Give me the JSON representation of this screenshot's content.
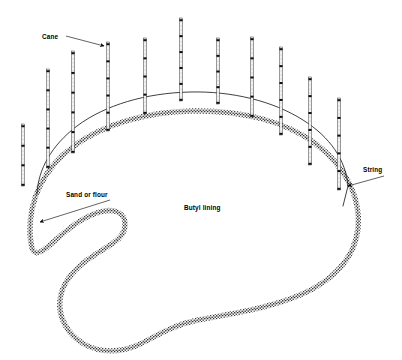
{
  "figure": {
    "title_visible": false,
    "background_color": "#ffffff",
    "ink_color": "#000000",
    "stipple_color": "#4d4d4d"
  },
  "labels": [
    {
      "name": "cane",
      "text": "Cane",
      "text_x": 42,
      "text_y": 39,
      "leader": {
        "x1": 66,
        "y1": 36,
        "x2": 104,
        "y2": 46
      },
      "arrow": true
    },
    {
      "name": "sand-or-flour",
      "text": "Sand or flour",
      "text_x": 66,
      "text_y": 197,
      "leader": {
        "x1": 110,
        "y1": 200,
        "x2": 40,
        "y2": 222
      },
      "arrow": true
    },
    {
      "name": "butyl-lining",
      "text": "Butyl lining",
      "text_x": 184,
      "text_y": 210,
      "leader": null,
      "arrow": false
    },
    {
      "name": "string",
      "text": "String",
      "text_x": 363,
      "text_y": 172,
      "leader": {
        "x1": 384,
        "y1": 176,
        "x2": 348,
        "y2": 186
      },
      "arrow": true
    }
  ],
  "canes": [
    {
      "index": 1,
      "x": 23,
      "top": 124,
      "bottom": 186,
      "nodes": 4
    },
    {
      "index": 2,
      "x": 48,
      "top": 69,
      "bottom": 168,
      "nodes": 6
    },
    {
      "index": 3,
      "x": 73,
      "top": 51,
      "bottom": 153,
      "nodes": 6
    },
    {
      "index": 4,
      "x": 108,
      "top": 42,
      "bottom": 131,
      "nodes": 6
    },
    {
      "index": 5,
      "x": 145,
      "top": 38,
      "bottom": 114,
      "nodes": 5
    },
    {
      "index": 6,
      "x": 181,
      "top": 18,
      "bottom": 101,
      "nodes": 6
    },
    {
      "index": 7,
      "x": 218,
      "top": 38,
      "bottom": 104,
      "nodes": 5
    },
    {
      "index": 8,
      "x": 252,
      "top": 37,
      "bottom": 117,
      "nodes": 5
    },
    {
      "index": 9,
      "x": 281,
      "top": 47,
      "bottom": 135,
      "nodes": 6
    },
    {
      "index": 10,
      "x": 310,
      "top": 77,
      "bottom": 165,
      "nodes": 6
    },
    {
      "index": 11,
      "x": 339,
      "top": 98,
      "bottom": 190,
      "nodes": 6
    }
  ],
  "pond": {
    "shape": "kidney",
    "sand_band_path": "M 30 233 C 29 199 44 168 74 146 C 104 124 146 112 192 111 C 240 110 286 121 316 144 C 346 167 361 198 358 228 C 355 258 333 281 300 295 C 267 309 228 314 198 320 C 172 325 155 337 138 345 C 120 353 100 353 84 344 C 68 335 58 318 60 300 C 62 282 76 267 93 256 C 111 244 124 239 125 226 C 126 213 115 206 94 214 C 72 222 52 245 42 251 C 33 256 31 250 30 233 Z",
    "string_path": "M 348 186 C 346 160 330 137 303 120 C 273 101 232 91 190 92 C 146 93 105 105 77 126 C 52 145 38 169 37 194"
  }
}
